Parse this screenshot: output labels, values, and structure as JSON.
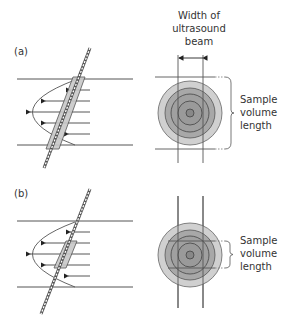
{
  "figure": {
    "panels": [
      {
        "id": "a",
        "label": "(a)",
        "sample_volume_label": [
          "Sample",
          "volume",
          "length"
        ]
      },
      {
        "id": "b",
        "label": "(b)",
        "sample_volume_label": [
          "Sample",
          "volume",
          "length"
        ]
      }
    ],
    "beam_width_label": [
      "Width of",
      "ultrasound",
      "beam"
    ],
    "colors": {
      "line": "#555555",
      "ring_outer": "#cfcfcf",
      "ring_mid": "#b0b0b0",
      "ring_inner": "#9a9a9a",
      "core": "#8a8a8a",
      "gate_fill": "#c8c8c8"
    }
  }
}
